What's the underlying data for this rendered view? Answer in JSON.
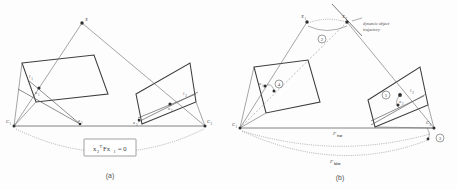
{
  "figure": {
    "background_color": "#fdfdfd",
    "line_color": "#3c3c3c",
    "ray_color": "#6d6d6d",
    "dotted_color": "#8a8a8a"
  },
  "panel_a": {
    "caption": "(a)",
    "equation": {
      "base": "x",
      "sub1": "2",
      "sup": "T",
      "mid": "Fx",
      "sub2": "1",
      "tail": "= 0",
      "full_text": "x₂ᵀFx₁ = 0"
    },
    "points": [
      {
        "name": "world-point",
        "label": "X",
        "sub": ""
      },
      {
        "name": "camera-center-1",
        "label": "C",
        "sub": "1"
      },
      {
        "name": "camera-center-2",
        "label": "C",
        "sub": "2"
      },
      {
        "name": "image-point-1",
        "label": "x",
        "sub": "1"
      },
      {
        "name": "image-point-2",
        "label": "x",
        "sub": "2"
      },
      {
        "name": "epipole-1",
        "label": "e",
        "sub": "1"
      },
      {
        "name": "epipole-2",
        "label": "e",
        "sub": "2"
      },
      {
        "name": "epipolar-line-1",
        "label": "l",
        "sub": "1"
      },
      {
        "name": "epipolar-line-2",
        "label": "l",
        "sub": "2"
      }
    ]
  },
  "panel_b": {
    "caption": "(b)",
    "annotation_trajectory": "dynamic object trajectory",
    "annotation_trajectory_line1": "dynamic object",
    "annotation_trajectory_line2": "trajectory",
    "trajectory_arrow_label": "→",
    "points": [
      {
        "name": "world-point-1",
        "label": "X",
        "sub": "1"
      },
      {
        "name": "world-point-2",
        "label": "X",
        "sub": "2"
      },
      {
        "name": "camera-center-1",
        "label": "C",
        "sub": "1"
      },
      {
        "name": "camera-center-2",
        "label": "C",
        "sub": "2"
      },
      {
        "name": "image-point-1",
        "label": "x",
        "sub": "1"
      },
      {
        "name": "image-point-2",
        "label": "x",
        "sub": "2"
      },
      {
        "name": "epipole-1",
        "label": "e",
        "sub": "1"
      },
      {
        "name": "epipole-2",
        "label": "e",
        "sub": "2"
      },
      {
        "name": "epipolar-line-2",
        "label": "l",
        "sub": "2"
      }
    ],
    "step_markers": [
      {
        "name": "step-1",
        "label": "1"
      },
      {
        "name": "step-2",
        "label": "2"
      },
      {
        "name": "step-3",
        "label": "3"
      },
      {
        "name": "step-4",
        "label": "4"
      }
    ],
    "fundamental_labels": [
      {
        "name": "f-true",
        "base": "F",
        "sub": "true"
      },
      {
        "name": "f-false",
        "base": "F",
        "sub": "false"
      }
    ]
  }
}
